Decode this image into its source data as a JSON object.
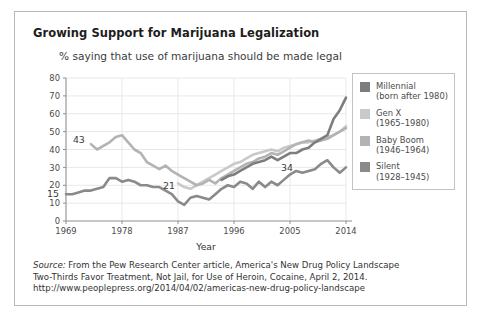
{
  "chart_data": {
    "type": "line",
    "title": "Growing Support for Marijuana Legalization",
    "subtitle": "% saying that use of marijuana should be made legal",
    "xlabel": "Year",
    "ylabel": "",
    "xlim": [
      1969,
      2014
    ],
    "ylim": [
      0,
      80
    ],
    "yticks": [
      0,
      10,
      20,
      30,
      40,
      50,
      60,
      70,
      80
    ],
    "xticks": [
      1969,
      1978,
      1987,
      1996,
      2005,
      2014
    ],
    "grid": true,
    "legend_position": "right",
    "series": [
      {
        "name": "Millennial",
        "sublabel": "(born after 1980)",
        "color": "#7d7d7d",
        "x": [
          1994,
          1995,
          1996,
          1997,
          1998,
          1999,
          2000,
          2001,
          2002,
          2003,
          2004,
          2005,
          2006,
          2007,
          2008,
          2009,
          2010,
          2011,
          2012,
          2013,
          2014
        ],
        "values": [
          23,
          25,
          26,
          28,
          30,
          32,
          33,
          34,
          36,
          34,
          36,
          38,
          38,
          40,
          41,
          44,
          46,
          48,
          57,
          62,
          69
        ],
        "end_label": 69
      },
      {
        "name": "Gen X",
        "sublabel": "(1965–1980)",
        "color": "#c9c9c9",
        "x": [
          1987,
          1988,
          1989,
          1990,
          1991,
          1992,
          1993,
          1994,
          1995,
          1996,
          1997,
          1998,
          1999,
          2000,
          2001,
          2002,
          2003,
          2004,
          2005,
          2006,
          2007,
          2008,
          2009,
          2010,
          2011,
          2012,
          2013,
          2014
        ],
        "values": [
          21,
          19,
          18,
          20,
          22,
          24,
          26,
          28,
          30,
          32,
          33,
          35,
          37,
          38,
          39,
          40,
          39,
          41,
          42,
          43,
          44,
          44,
          45,
          46,
          47,
          48,
          50,
          53
        ],
        "end_label": 53
      },
      {
        "name": "Baby Boom",
        "sublabel": "(1946–1964)",
        "color": "#b3b3b3",
        "x": [
          1973,
          1974,
          1975,
          1976,
          1977,
          1978,
          1979,
          1980,
          1981,
          1982,
          1983,
          1984,
          1985,
          1986,
          1987,
          1988,
          1989,
          1990,
          1991,
          1992,
          1993,
          1994,
          1995,
          1996,
          1997,
          1998,
          1999,
          2000,
          2001,
          2002,
          2003,
          2004,
          2005,
          2006,
          2007,
          2008,
          2009,
          2010,
          2011,
          2012,
          2013,
          2014
        ],
        "values": [
          43,
          40,
          42,
          44,
          47,
          48,
          44,
          40,
          38,
          33,
          31,
          29,
          31,
          28,
          26,
          24,
          22,
          20,
          21,
          23,
          21,
          24,
          26,
          28,
          30,
          32,
          33,
          35,
          36,
          38,
          37,
          39,
          41,
          43,
          44,
          45,
          44,
          45,
          46,
          48,
          50,
          52
        ],
        "end_label": 52,
        "start_label": 43
      },
      {
        "name": "Silent",
        "sublabel": "(1928–1945)",
        "color": "#8a8a8a",
        "x": [
          1969,
          1970,
          1971,
          1972,
          1973,
          1974,
          1975,
          1976,
          1977,
          1978,
          1979,
          1980,
          1981,
          1982,
          1983,
          1984,
          1985,
          1986,
          1987,
          1988,
          1989,
          1990,
          1991,
          1992,
          1993,
          1994,
          1995,
          1996,
          1997,
          1998,
          1999,
          2000,
          2001,
          2002,
          2003,
          2004,
          2005,
          2006,
          2007,
          2008,
          2009,
          2010,
          2011,
          2012,
          2013,
          2014
        ],
        "values": [
          15,
          15,
          16,
          17,
          17,
          18,
          19,
          24,
          24,
          22,
          23,
          22,
          20,
          20,
          19,
          19,
          17,
          15,
          11,
          9,
          13,
          14,
          13,
          12,
          15,
          18,
          20,
          19,
          22,
          21,
          18,
          22,
          19,
          22,
          20,
          23,
          26,
          28,
          27,
          28,
          29,
          32,
          34,
          30,
          27,
          30
        ],
        "end_label": 30,
        "start_label": 15
      }
    ],
    "annotations": [
      {
        "label": "15",
        "series": "Silent",
        "year": 1969,
        "value": 15
      },
      {
        "label": "43",
        "series": "Baby Boom",
        "year": 1973,
        "value": 43
      },
      {
        "label": "21",
        "series": "Gen X",
        "year": 1987,
        "value": 21
      },
      {
        "label": "34",
        "series": "Millennial",
        "year": 2005,
        "value": 34
      },
      {
        "label": "69",
        "series": "Millennial",
        "year": 2014,
        "value": 69
      },
      {
        "label": "53",
        "series": "Gen X",
        "year": 2014,
        "value": 53
      },
      {
        "label": "52",
        "series": "Baby Boom",
        "year": 2014,
        "value": 52
      },
      {
        "label": "30",
        "series": "Silent",
        "year": 2014,
        "value": 30
      }
    ]
  },
  "legend": {
    "items": [
      {
        "label": "Millennial",
        "sublabel": "(born after 1980)",
        "color": "#7d7d7d"
      },
      {
        "label": "Gen X",
        "sublabel": "(1965–1980)",
        "color": "#c9c9c9"
      },
      {
        "label": "Baby Boom",
        "sublabel": "(1946–1964)",
        "color": "#b3b3b3"
      },
      {
        "label": "Silent",
        "sublabel": "(1928–1945)",
        "color": "#8a8a8a"
      }
    ]
  },
  "source": {
    "label": "Source:",
    "line1": " From the Pew Research Center article, America's New Drug Policy Landscape",
    "line2": "Two-Thirds Favor Treatment, Not Jail, for Use of Heroin, Cocaine, April 2, 2014.",
    "line3": "http://www.peoplepress.org/2014/04/02/americas-new-drug-policy-landscape"
  }
}
